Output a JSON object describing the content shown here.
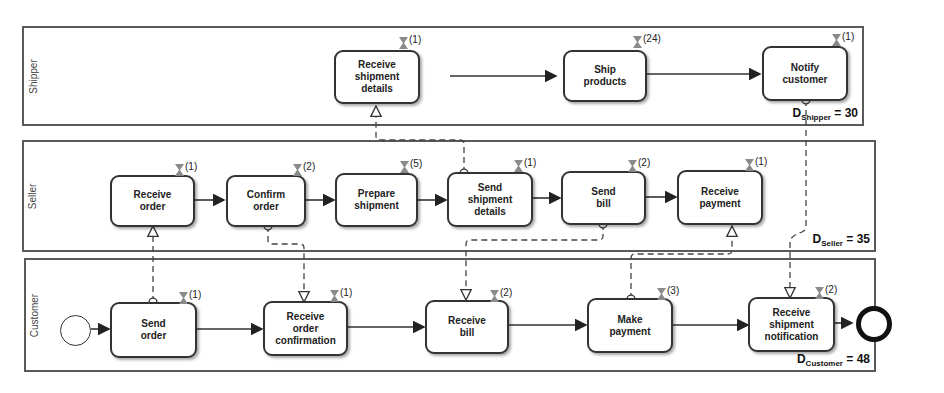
{
  "lanes": [
    {
      "id": "shipper",
      "label": "Shipper",
      "duration_prefix": "D",
      "duration_sub": "Shipper",
      "duration_value": "= 30"
    },
    {
      "id": "seller",
      "label": "Seller",
      "duration_prefix": "D",
      "duration_sub": "Seller",
      "duration_value": "= 35"
    },
    {
      "id": "customer",
      "label": "Customer",
      "duration_prefix": "D",
      "duration_sub": "Customer",
      "duration_value": "= 48"
    }
  ],
  "tasks": {
    "shipper": [
      {
        "label": "Receive\nshipment\ndetails",
        "duration": "(1)"
      },
      {
        "label": "Ship\nproducts",
        "duration": "(24)"
      },
      {
        "label": "Notify\ncustomer",
        "duration": "(1)"
      }
    ],
    "seller": [
      {
        "label": "Receive\norder",
        "duration": "(1)"
      },
      {
        "label": "Confirm\norder",
        "duration": "(2)"
      },
      {
        "label": "Prepare\nshipment",
        "duration": "(5)"
      },
      {
        "label": "Send\nshipment\ndetails",
        "duration": "(1)"
      },
      {
        "label": "Send\nbill",
        "duration": "(2)"
      },
      {
        "label": "Receive\npayment",
        "duration": "(1)"
      }
    ],
    "customer": [
      {
        "label": "Send\norder",
        "duration": "(1)"
      },
      {
        "label": "Receive\norder\nconfirmation",
        "duration": "(1)"
      },
      {
        "label": "Receive\nbill",
        "duration": "(2)"
      },
      {
        "label": "Make\npayment",
        "duration": "(3)"
      },
      {
        "label": "Receive\nshipment\nnotification",
        "duration": "(2)"
      }
    ]
  },
  "events": {
    "start": "start-event",
    "end": "end-event"
  },
  "colors": {
    "stroke": "#333333",
    "lane_border": "#5a5a5a",
    "timer": "#8a8a8a"
  }
}
